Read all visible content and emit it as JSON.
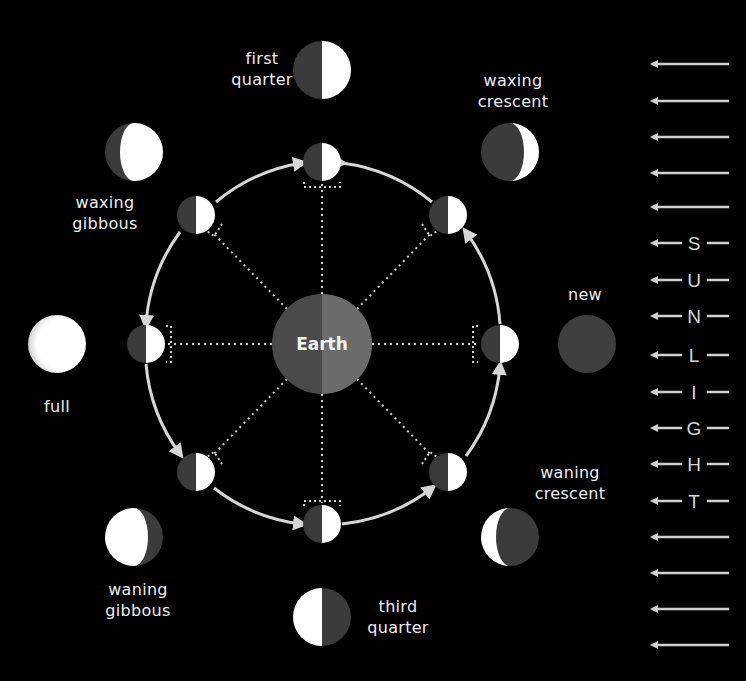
{
  "diagram": {
    "center_label": "Earth",
    "colors": {
      "background": "#000000",
      "earth_dark": "#4a4a4a",
      "earth_light": "#6a6a6a",
      "moon_dark": "#3b3b3b",
      "moon_lit": "#ffffff",
      "orbit": "#d6d6d6",
      "sunlight": "#d0d0d0"
    },
    "orbit_direction": "counterclockwise",
    "phases": [
      {
        "id": "new",
        "label_lines": [
          "new"
        ]
      },
      {
        "id": "waxing-crescent",
        "label_lines": [
          "waxing",
          "crescent"
        ]
      },
      {
        "id": "first-quarter",
        "label_lines": [
          "first",
          "quarter"
        ]
      },
      {
        "id": "waxing-gibbous",
        "label_lines": [
          "waxing",
          "gibbous"
        ]
      },
      {
        "id": "full",
        "label_lines": [
          "full"
        ]
      },
      {
        "id": "waning-gibbous",
        "label_lines": [
          "waning",
          "gibbous"
        ]
      },
      {
        "id": "third-quarter",
        "label_lines": [
          "third",
          "quarter"
        ]
      },
      {
        "id": "waning-crescent",
        "label_lines": [
          "waning",
          "crescent"
        ]
      }
    ],
    "sunlight": {
      "letters": [
        "S",
        "U",
        "N",
        "L",
        "I",
        "G",
        "H",
        "T"
      ],
      "plain_arrows_above": 5,
      "plain_arrows_below": 4,
      "direction": "left"
    }
  }
}
